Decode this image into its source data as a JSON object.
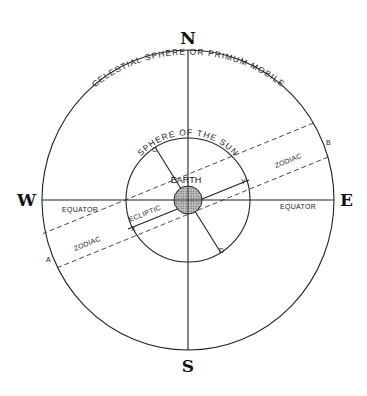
{
  "diagram": {
    "type": "geocentric celestial sphere",
    "compass": {
      "north": "N",
      "south": "S",
      "west": "W",
      "east": "E"
    },
    "outer_sphere_label": "CELESTIAL SPHERE OR PRIMUM MOBILE",
    "inner_sphere_label": "SPHERE OF THE SUN",
    "center_label": "EARTH",
    "labels": {
      "equator_left": "EQUATOR",
      "equator_right": "EQUATOR",
      "ecliptic": "ECLIPTIC",
      "zodiac_left": "ZODIAC",
      "zodiac_right": "ZODIAC",
      "point_a": "A",
      "point_b": "B",
      "point_c": "C",
      "point_d": "D",
      "point_x": "X",
      "point_y": "Y"
    },
    "colors": {
      "ink": "#222222",
      "earth_fill": "#aaaaaa",
      "background": "#ffffff"
    }
  }
}
